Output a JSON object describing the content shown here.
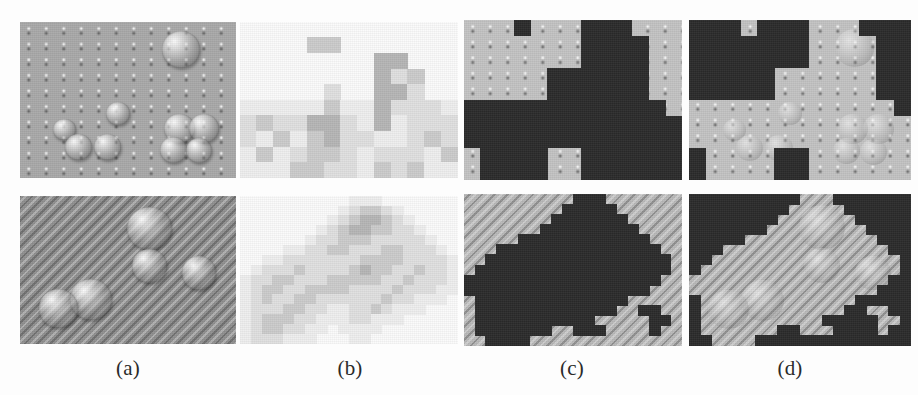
{
  "figure": {
    "width": 918,
    "height": 395,
    "background": "#fdfdfd",
    "type": "image-grid",
    "rows": 2,
    "columns": 4
  },
  "labels": [
    {
      "id": "a",
      "text": "(a)",
      "x": 128,
      "y": 356
    },
    {
      "id": "b",
      "text": "(b)",
      "x": 350,
      "y": 356
    },
    {
      "id": "c",
      "text": "(c)",
      "x": 572,
      "y": 356
    },
    {
      "id": "d",
      "text": "(d)",
      "x": 790,
      "y": 356
    }
  ],
  "columns": [
    {
      "key": "a",
      "name": "original-micrograph"
    },
    {
      "key": "b",
      "name": "quantized-block-map"
    },
    {
      "key": "c",
      "name": "binary-segmentation-mask"
    },
    {
      "key": "d",
      "name": "masked-original"
    }
  ],
  "rows": [
    {
      "key": "top",
      "name": "sample-row-dotted-substrate"
    },
    {
      "key": "bottom",
      "name": "sample-row-striped-substrate"
    }
  ],
  "palette": {
    "mask_foreground": "#2b2b2b",
    "substrate_dots": "#a9a9a9",
    "substrate_dots_light": "#c3c3c3",
    "substrate_stripes": "#8f8f8f",
    "substrate_stripes_light": "#b9b9b9",
    "page_background": "#fdfdfd",
    "label_text": "#2a2a2a"
  },
  "panels": {
    "a_top": {
      "x": 20,
      "y": 22,
      "w": 216,
      "h": 156
    },
    "b_top": {
      "x": 240,
      "y": 22,
      "w": 218,
      "h": 156
    },
    "c_top": {
      "x": 464,
      "y": 20,
      "w": 218,
      "h": 160
    },
    "d_top": {
      "x": 689,
      "y": 20,
      "w": 222,
      "h": 160
    },
    "a_bottom": {
      "x": 20,
      "y": 196,
      "w": 216,
      "h": 148
    },
    "b_bottom": {
      "x": 240,
      "y": 196,
      "w": 218,
      "h": 148
    },
    "c_bottom": {
      "x": 464,
      "y": 194,
      "w": 218,
      "h": 152
    },
    "d_bottom": {
      "x": 689,
      "y": 194,
      "w": 222,
      "h": 152
    }
  },
  "chart_data": {
    "type": "heatmap",
    "title": "",
    "grid": {
      "top_row": {
        "cols": 13,
        "rows": 10,
        "note": "coarse mosaic quantization of panel (a) top"
      },
      "bottom_row": {
        "cols": 20,
        "rows": 15,
        "note": "fine mosaic quantization of panel (a) bottom"
      }
    },
    "levels": [
      "#fbfbfb",
      "#efefef",
      "#e0e0e0",
      "#cccccc",
      "#b6b6b6",
      "#a3a3a3"
    ]
  },
  "mosaic_top": {
    "cols": 13,
    "rows": 10,
    "cell_w": 16.8,
    "cell_h": 15.6,
    "cells": [
      [
        0,
        0,
        0,
        0,
        0,
        0,
        0,
        0,
        0,
        0,
        0,
        0,
        0
      ],
      [
        0,
        0,
        0,
        0,
        3,
        3,
        0,
        0,
        0,
        0,
        0,
        0,
        0
      ],
      [
        0,
        0,
        0,
        0,
        0,
        0,
        0,
        0,
        4,
        4,
        0,
        0,
        0
      ],
      [
        0,
        0,
        0,
        0,
        0,
        0,
        0,
        0,
        4,
        2,
        3,
        0,
        0
      ],
      [
        0,
        0,
        0,
        0,
        0,
        2,
        0,
        0,
        4,
        4,
        2,
        0,
        0
      ],
      [
        1,
        1,
        1,
        1,
        1,
        3,
        1,
        1,
        4,
        2,
        2,
        2,
        1
      ],
      [
        2,
        3,
        2,
        2,
        4,
        4,
        2,
        1,
        4,
        1,
        2,
        2,
        2
      ],
      [
        2,
        1,
        3,
        1,
        3,
        4,
        2,
        2,
        1,
        1,
        2,
        3,
        2
      ],
      [
        1,
        3,
        1,
        2,
        3,
        3,
        2,
        1,
        2,
        2,
        2,
        1,
        3
      ],
      [
        1,
        1,
        1,
        3,
        3,
        2,
        2,
        1,
        3,
        2,
        3,
        1,
        1
      ]
    ]
  },
  "mosaic_bottom": {
    "cols": 20,
    "rows": 15,
    "cell_w": 10.9,
    "cell_h": 9.9,
    "cells": [
      [
        0,
        0,
        0,
        0,
        0,
        0,
        0,
        0,
        0,
        0,
        1,
        1,
        1,
        0,
        0,
        0,
        0,
        0,
        0,
        0
      ],
      [
        0,
        0,
        0,
        0,
        0,
        0,
        0,
        0,
        0,
        1,
        2,
        3,
        3,
        2,
        1,
        0,
        0,
        0,
        0,
        0
      ],
      [
        0,
        0,
        0,
        0,
        0,
        0,
        0,
        0,
        1,
        2,
        3,
        4,
        4,
        3,
        2,
        1,
        0,
        0,
        0,
        0
      ],
      [
        0,
        0,
        0,
        0,
        0,
        0,
        0,
        1,
        2,
        3,
        4,
        4,
        3,
        3,
        2,
        2,
        1,
        0,
        0,
        0
      ],
      [
        0,
        0,
        0,
        0,
        0,
        0,
        1,
        2,
        2,
        3,
        3,
        3,
        2,
        2,
        2,
        2,
        2,
        1,
        0,
        0
      ],
      [
        0,
        0,
        0,
        0,
        1,
        1,
        2,
        2,
        3,
        3,
        2,
        2,
        2,
        3,
        3,
        2,
        2,
        2,
        1,
        0
      ],
      [
        0,
        0,
        1,
        1,
        2,
        2,
        2,
        2,
        2,
        2,
        2,
        3,
        3,
        3,
        3,
        2,
        2,
        2,
        2,
        1
      ],
      [
        0,
        1,
        2,
        2,
        2,
        3,
        2,
        2,
        2,
        2,
        3,
        4,
        3,
        3,
        2,
        2,
        3,
        2,
        2,
        1
      ],
      [
        1,
        2,
        2,
        3,
        3,
        2,
        2,
        2,
        3,
        3,
        3,
        3,
        3,
        2,
        2,
        3,
        2,
        2,
        2,
        1
      ],
      [
        1,
        2,
        3,
        3,
        2,
        2,
        3,
        3,
        3,
        3,
        2,
        2,
        2,
        2,
        3,
        2,
        2,
        2,
        1,
        1
      ],
      [
        1,
        2,
        3,
        2,
        2,
        3,
        3,
        2,
        2,
        2,
        2,
        2,
        2,
        3,
        2,
        2,
        1,
        1,
        1,
        0
      ],
      [
        1,
        2,
        2,
        2,
        3,
        3,
        2,
        2,
        1,
        1,
        2,
        2,
        3,
        2,
        1,
        1,
        1,
        0,
        0,
        0
      ],
      [
        1,
        2,
        3,
        3,
        3,
        2,
        2,
        1,
        1,
        1,
        2,
        2,
        1,
        1,
        1,
        0,
        0,
        0,
        0,
        0
      ],
      [
        1,
        2,
        3,
        3,
        2,
        2,
        1,
        1,
        0,
        1,
        1,
        1,
        1,
        0,
        0,
        0,
        0,
        0,
        0,
        0
      ],
      [
        1,
        2,
        2,
        2,
        1,
        1,
        1,
        0,
        0,
        0,
        1,
        1,
        0,
        0,
        0,
        0,
        0,
        0,
        0,
        0
      ]
    ]
  },
  "mask_top": {
    "cols": 13,
    "rows": 10,
    "cells": [
      [
        0,
        0,
        0,
        1,
        0,
        0,
        0,
        1,
        1,
        1,
        0,
        0,
        0
      ],
      [
        0,
        0,
        0,
        0,
        0,
        0,
        0,
        1,
        1,
        1,
        1,
        0,
        0
      ],
      [
        0,
        0,
        0,
        0,
        0,
        0,
        0,
        1,
        1,
        1,
        1,
        0,
        0
      ],
      [
        0,
        0,
        0,
        0,
        0,
        1,
        1,
        1,
        1,
        1,
        1,
        0,
        0
      ],
      [
        0,
        0,
        0,
        0,
        0,
        1,
        1,
        1,
        1,
        1,
        1,
        0,
        0
      ],
      [
        1,
        1,
        1,
        1,
        1,
        1,
        1,
        1,
        1,
        1,
        1,
        1,
        0
      ],
      [
        1,
        1,
        1,
        1,
        1,
        1,
        1,
        1,
        1,
        1,
        1,
        1,
        1
      ],
      [
        1,
        1,
        1,
        1,
        1,
        1,
        1,
        1,
        1,
        1,
        1,
        1,
        1
      ],
      [
        0,
        1,
        1,
        1,
        1,
        0,
        0,
        1,
        1,
        1,
        1,
        1,
        1
      ],
      [
        0,
        1,
        1,
        1,
        1,
        0,
        0,
        1,
        1,
        1,
        1,
        1,
        1
      ]
    ]
  },
  "mask_bottom": {
    "cols": 20,
    "rows": 15,
    "cells": [
      [
        0,
        0,
        0,
        0,
        0,
        0,
        0,
        0,
        0,
        0,
        1,
        1,
        1,
        0,
        0,
        0,
        0,
        0,
        0,
        0
      ],
      [
        0,
        0,
        0,
        0,
        0,
        0,
        0,
        0,
        0,
        1,
        1,
        1,
        1,
        1,
        0,
        0,
        0,
        0,
        0,
        0
      ],
      [
        0,
        0,
        0,
        0,
        0,
        0,
        0,
        0,
        1,
        1,
        1,
        1,
        1,
        1,
        1,
        0,
        0,
        0,
        0,
        0
      ],
      [
        0,
        0,
        0,
        0,
        0,
        0,
        0,
        1,
        1,
        1,
        1,
        1,
        1,
        1,
        1,
        1,
        0,
        0,
        0,
        0
      ],
      [
        0,
        0,
        0,
        0,
        0,
        1,
        1,
        1,
        1,
        1,
        1,
        1,
        1,
        1,
        1,
        1,
        1,
        0,
        0,
        0
      ],
      [
        0,
        0,
        0,
        1,
        1,
        1,
        1,
        1,
        1,
        1,
        1,
        1,
        1,
        1,
        1,
        1,
        1,
        1,
        0,
        0
      ],
      [
        0,
        0,
        1,
        1,
        1,
        1,
        1,
        1,
        1,
        1,
        1,
        1,
        1,
        1,
        1,
        1,
        1,
        1,
        1,
        0
      ],
      [
        0,
        1,
        1,
        1,
        1,
        1,
        1,
        1,
        1,
        1,
        1,
        1,
        1,
        1,
        1,
        1,
        1,
        1,
        1,
        0
      ],
      [
        1,
        1,
        1,
        1,
        1,
        1,
        1,
        1,
        1,
        1,
        1,
        1,
        1,
        1,
        1,
        1,
        1,
        1,
        0,
        0
      ],
      [
        1,
        1,
        1,
        1,
        1,
        1,
        1,
        1,
        1,
        1,
        1,
        1,
        1,
        1,
        1,
        1,
        1,
        0,
        0,
        0
      ],
      [
        0,
        1,
        1,
        1,
        1,
        1,
        1,
        1,
        1,
        1,
        1,
        1,
        1,
        1,
        1,
        0,
        0,
        0,
        0,
        0
      ],
      [
        0,
        1,
        1,
        1,
        1,
        1,
        1,
        1,
        1,
        1,
        1,
        1,
        1,
        1,
        0,
        0,
        1,
        1,
        0,
        0
      ],
      [
        0,
        1,
        1,
        1,
        1,
        1,
        1,
        1,
        1,
        1,
        1,
        1,
        0,
        0,
        0,
        0,
        0,
        1,
        1,
        0
      ],
      [
        0,
        1,
        1,
        1,
        1,
        1,
        1,
        1,
        0,
        0,
        1,
        1,
        1,
        0,
        0,
        0,
        0,
        1,
        0,
        0
      ],
      [
        0,
        0,
        1,
        1,
        1,
        1,
        0,
        0,
        0,
        0,
        0,
        0,
        0,
        0,
        0,
        0,
        0,
        0,
        0,
        0
      ]
    ]
  },
  "blobs_top": [
    {
      "x": 0.745,
      "y": 0.175,
      "r": 0.088
    },
    {
      "x": 0.455,
      "y": 0.585,
      "r": 0.055
    },
    {
      "x": 0.205,
      "y": 0.69,
      "r": 0.052
    },
    {
      "x": 0.272,
      "y": 0.8,
      "r": 0.062
    },
    {
      "x": 0.405,
      "y": 0.8,
      "r": 0.062
    },
    {
      "x": 0.738,
      "y": 0.68,
      "r": 0.07
    },
    {
      "x": 0.852,
      "y": 0.68,
      "r": 0.07
    },
    {
      "x": 0.71,
      "y": 0.82,
      "r": 0.062
    },
    {
      "x": 0.83,
      "y": 0.825,
      "r": 0.06
    }
  ],
  "blobs_bottom": [
    {
      "x": 0.6,
      "y": 0.22,
      "r": 0.105
    },
    {
      "x": 0.6,
      "y": 0.47,
      "r": 0.082
    },
    {
      "x": 0.828,
      "y": 0.52,
      "r": 0.08
    },
    {
      "x": 0.33,
      "y": 0.7,
      "r": 0.098
    },
    {
      "x": 0.178,
      "y": 0.76,
      "r": 0.092
    }
  ]
}
